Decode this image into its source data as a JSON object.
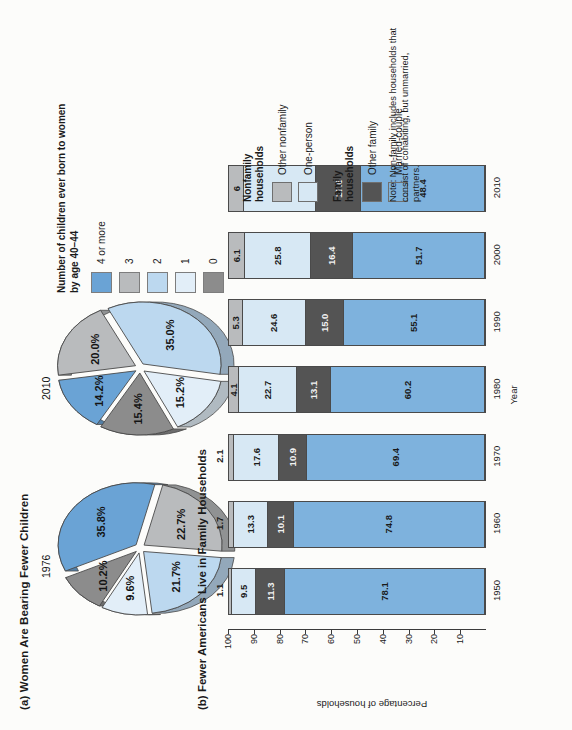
{
  "figure": {
    "panel_a": {
      "title": "(a) Women Are Bearing Fewer Children",
      "legend_title": "Number of children\never born to women\nby age 40–44",
      "legend_items": [
        {
          "label": "4 or more",
          "color": "#6aa3d5"
        },
        {
          "label": "3",
          "color": "#b9bbbd"
        },
        {
          "label": "2",
          "color": "#bcd8ef"
        },
        {
          "label": "1",
          "color": "#e2eef8"
        },
        {
          "label": "0",
          "color": "#8c8c8c"
        }
      ],
      "pies": [
        {
          "year": "1976",
          "slices": [
            {
              "category": "4 or more",
              "label": "35.8%",
              "value": 35.8,
              "color": "#6aa3d5"
            },
            {
              "category": "3",
              "label": "22.7%",
              "value": 22.7,
              "color": "#b9bbbd"
            },
            {
              "category": "2",
              "label": "21.7%",
              "value": 21.7,
              "color": "#bcd8ef"
            },
            {
              "category": "1",
              "label": "9.6%",
              "value": 9.6,
              "color": "#e2eef8"
            },
            {
              "category": "0",
              "label": "10.2%",
              "value": 10.2,
              "color": "#8c8c8c"
            }
          ]
        },
        {
          "year": "2010",
          "slices": [
            {
              "category": "4 or more",
              "label": "14.2%",
              "value": 14.2,
              "color": "#6aa3d5"
            },
            {
              "category": "3",
              "label": "20.0%",
              "value": 20.0,
              "color": "#b9bbbd"
            },
            {
              "category": "2",
              "label": "35.0%",
              "value": 35.0,
              "color": "#bcd8ef"
            },
            {
              "category": "1",
              "label": "15.2%",
              "value": 15.2,
              "color": "#e2eef8"
            },
            {
              "category": "0",
              "label": "15.4%",
              "value": 15.4,
              "color": "#8c8c8c"
            }
          ]
        }
      ]
    },
    "panel_b": {
      "title": "(b) Fewer Americans Live in Family Households",
      "xlabel": "Year",
      "ylabel": "Percentage of households",
      "yticks": [
        "100",
        "90",
        "80",
        "70",
        "60",
        "50",
        "40",
        "30",
        "20",
        "10"
      ],
      "note": "Note: Non-family includes households that consist of cohabiting, but unmarried, partners.",
      "legend_groups": [
        {
          "group": "Nonfamily\nhouseholds",
          "items": [
            {
              "label": "Other nonfamily",
              "color": "#b9bbbd"
            },
            {
              "label": "One-person",
              "color": "#d7e8f4"
            }
          ]
        },
        {
          "group": "Family\nhouseholds",
          "items": [
            {
              "label": "Other family",
              "color": "#545454"
            },
            {
              "label": "Married-couple",
              "color": "#7eb2dd"
            }
          ]
        }
      ]
    }
  },
  "chart_data": [
    {
      "type": "pie",
      "title": "(a) Women Are Bearing Fewer Children — 1976",
      "labels": [
        "4 or more",
        "3",
        "2",
        "1",
        "0"
      ],
      "values": [
        35.8,
        22.7,
        21.7,
        9.6,
        10.2
      ],
      "data_labels": [
        "35.8%",
        "22.7%",
        "21.7%",
        "9.6%",
        "10.2%"
      ],
      "legend_title": "Number of children ever born to women by age 40–44",
      "legend_position": "right",
      "colors": [
        "#6aa3d5",
        "#b9bbbd",
        "#bcd8ef",
        "#e2eef8",
        "#8c8c8c"
      ]
    },
    {
      "type": "pie",
      "title": "(a) Women Are Bearing Fewer Children — 2010",
      "labels": [
        "4 or more",
        "3",
        "2",
        "1",
        "0"
      ],
      "values": [
        14.2,
        20.0,
        35.0,
        15.2,
        15.4
      ],
      "data_labels": [
        "14.2%",
        "20.0%",
        "35.0%",
        "15.2%",
        "15.4%"
      ],
      "legend_title": "Number of children ever born to women by age 40–44",
      "legend_position": "right",
      "colors": [
        "#6aa3d5",
        "#b9bbbd",
        "#bcd8ef",
        "#e2eef8",
        "#8c8c8c"
      ]
    },
    {
      "type": "bar",
      "subtype": "stacked-column",
      "title": "(b) Fewer Americans Live in Family Households",
      "xlabel": "Year",
      "ylabel": "Percentage of households",
      "ylim": [
        0,
        100
      ],
      "yticks": [
        10,
        20,
        30,
        40,
        50,
        60,
        70,
        80,
        90,
        100
      ],
      "grid": false,
      "legend_position": "right",
      "categories": [
        "1950",
        "1960",
        "1970",
        "1980",
        "1990",
        "2000",
        "2010"
      ],
      "series": [
        {
          "name": "Married-couple",
          "color": "#7eb2dd",
          "values": [
            78.1,
            74.8,
            69.4,
            60.2,
            55.1,
            51.7,
            48.4
          ],
          "labels": [
            "78.1",
            "74.8",
            "69.4",
            "60.2",
            "55.1",
            "51.7",
            "48.4"
          ]
        },
        {
          "name": "Other family",
          "color": "#545454",
          "values": [
            11.3,
            10.1,
            10.9,
            13.1,
            15.0,
            16.4,
            17.6
          ],
          "labels": [
            "11.3",
            "10.1",
            "10.9",
            "13.1",
            "15.0",
            "16.4",
            "17.6"
          ]
        },
        {
          "name": "One-person",
          "color": "#d7e8f4",
          "values": [
            9.5,
            13.3,
            17.6,
            22.7,
            24.6,
            25.8,
            28
          ],
          "labels": [
            "9.5",
            "13.3",
            "17.6",
            "22.7",
            "24.6",
            "25.8",
            "28"
          ]
        },
        {
          "name": "Other nonfamily",
          "color": "#b9bbbd",
          "values": [
            1.1,
            1.7,
            2.1,
            4.1,
            5.3,
            6.1,
            6
          ],
          "labels": [
            "1.1",
            "1.7",
            "2.1",
            "4.1",
            "5.3",
            "6.1",
            "6"
          ]
        }
      ]
    }
  ]
}
